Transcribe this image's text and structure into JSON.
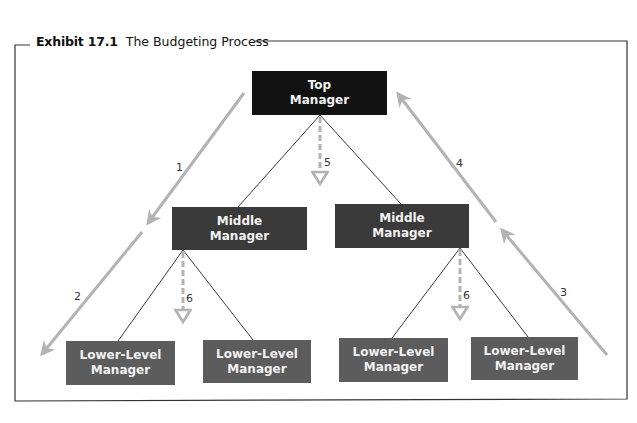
{
  "exhibit": {
    "number": "Exhibit 17.1",
    "title": "The Budgeting Process"
  },
  "nodes": {
    "top": {
      "line1": "Top",
      "line2": "Manager"
    },
    "middle_left": {
      "line1": "Middle",
      "line2": "Manager"
    },
    "middle_right": {
      "line1": "Middle",
      "line2": "Manager"
    },
    "lower_1": {
      "line1": "Lower-Level",
      "line2": "Manager"
    },
    "lower_2": {
      "line1": "Lower-Level",
      "line2": "Manager"
    },
    "lower_3": {
      "line1": "Lower-Level",
      "line2": "Manager"
    },
    "lower_4": {
      "line1": "Lower-Level",
      "line2": "Manager"
    }
  },
  "steps": {
    "s1": "1",
    "s2": "2",
    "s3": "3",
    "s4": "4",
    "s5": "5",
    "s6a": "6",
    "s6b": "6"
  },
  "colors": {
    "top_box": "#121212",
    "middle_box": "#3a3a3a",
    "lower_box": "#5c5c5c",
    "flow_arrow": "#b3b3b3",
    "frame": "#333333"
  }
}
